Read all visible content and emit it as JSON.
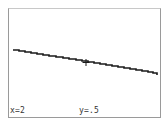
{
  "calculator_screen": {
    "graph": {
      "line_color": "#1a1a1a",
      "line_start": {
        "x": 13,
        "y": 50
      },
      "line_end": {
        "x": 157,
        "y": 75
      },
      "trace_cursor": {
        "x": 86,
        "y": 63
      }
    },
    "readout": {
      "x_label": "x=2",
      "y_label": "y=.5"
    }
  }
}
